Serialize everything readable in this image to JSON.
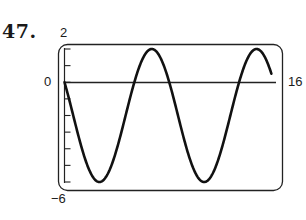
{
  "problem": {
    "number": "47."
  },
  "axis_labels": {
    "y_max": "2",
    "y_min": "−6",
    "y_zero": "0",
    "x_max": "16"
  },
  "chart_data": {
    "type": "line",
    "title": "",
    "xlabel": "",
    "ylabel": "",
    "xlim": [
      0,
      16
    ],
    "ylim": [
      -6,
      2
    ],
    "grid": false,
    "y_ticks": [
      2,
      1,
      0,
      -1,
      -2,
      -3,
      -4,
      -5,
      -6
    ],
    "tick_labels": {
      "y": [
        "2",
        "0",
        "−6"
      ],
      "x": [
        "16"
      ]
    },
    "function": "y = -2 + 4 sin(πx/4 + 5π/6)",
    "series": [
      {
        "name": "curve",
        "x": [
          0,
          1,
          2,
          2.67,
          3,
          4,
          5,
          6,
          6.67,
          7,
          8,
          9,
          10,
          10.67,
          11,
          12,
          13,
          14,
          14.67,
          15,
          15.8
        ],
        "y": [
          0,
          -3.03,
          -5.46,
          -6,
          -5.86,
          -4.0,
          -0.14,
          1.86,
          2,
          1.86,
          0,
          -3.03,
          -5.46,
          -6,
          -5.86,
          -4.0,
          -0.14,
          1.86,
          2,
          1.86,
          0.4
        ]
      }
    ],
    "stroke_color": "#111111",
    "frame_color": "#222222"
  }
}
